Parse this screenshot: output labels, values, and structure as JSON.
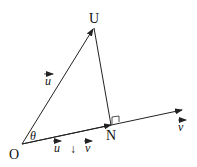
{
  "diagram": {
    "points": {
      "O": {
        "label": "O",
        "x": 22,
        "y": 144
      },
      "U": {
        "label": "U",
        "x": 94,
        "y": 28
      },
      "N": {
        "label": "N",
        "x": 111,
        "y": 125
      }
    },
    "vectors": {
      "u": {
        "label": "u",
        "from": "O",
        "to": "U"
      },
      "v": {
        "label": "v",
        "from": "O",
        "to_x": 182,
        "to_y": 110
      },
      "proj": {
        "label": "u ↓ v",
        "from": "O",
        "to": "N"
      }
    },
    "angle_label": "θ",
    "right_angle_at": "N",
    "colors": {
      "line": "#222222",
      "background": "#ffffff"
    }
  }
}
